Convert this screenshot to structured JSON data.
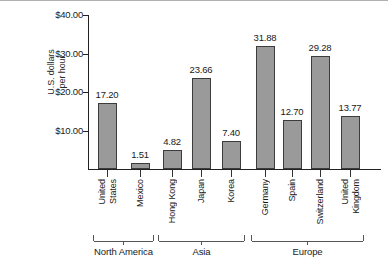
{
  "chart_data": {
    "type": "bar",
    "title": "",
    "subtitle": "",
    "xlabel": "",
    "ylabel": "U.S. dollars per hour",
    "ylabel_line1": "U.S. dollars",
    "ylabel_line2": "per hour",
    "categories": [
      "United States",
      "Mexico",
      "Hong Kong",
      "Japan",
      "Korea",
      "Germany",
      "Spain",
      "Switzerland",
      "United Kingdom"
    ],
    "values": [
      17.2,
      1.51,
      4.82,
      23.66,
      7.4,
      31.88,
      12.7,
      29.28,
      13.77
    ],
    "value_labels": [
      "17.20",
      "1.51",
      "4.82",
      "23.66",
      "7.40",
      "31.88",
      "12.70",
      "29.28",
      "13.77"
    ],
    "category_lines": [
      [
        "United",
        "States"
      ],
      [
        "Mexico"
      ],
      [
        "Hong Kong"
      ],
      [
        "Japan"
      ],
      [
        "Korea"
      ],
      [
        "Germany"
      ],
      [
        "Spain"
      ],
      [
        "Switzerland"
      ],
      [
        "United",
        "Kingdom"
      ]
    ],
    "ylim": [
      0,
      40
    ],
    "yticks": [
      10,
      20,
      30,
      40
    ],
    "ytick_labels": [
      "$10.00",
      "$20.00",
      "$30.00",
      "$40.00"
    ],
    "grid": false,
    "legend": "none",
    "bar_color": "#9a9a9a",
    "bar_outline_color": "#3c3c3c",
    "axis_color": "#222222",
    "groups": [
      {
        "label": "North America",
        "members": [
          "United States",
          "Mexico"
        ]
      },
      {
        "label": "Asia",
        "members": [
          "Hong Kong",
          "Japan",
          "Korea"
        ]
      },
      {
        "label": "Europe",
        "members": [
          "Germany",
          "Spain",
          "Switzerland",
          "United Kingdom"
        ]
      }
    ]
  }
}
